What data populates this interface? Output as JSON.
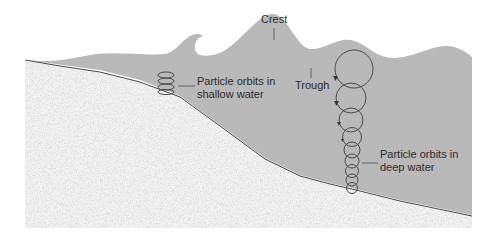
{
  "diagram": {
    "labels": {
      "crest": "Crest",
      "trough": "Trough",
      "shallow_line1": "Particle orbits in",
      "shallow_line2": "shallow water",
      "deep_line1": "Particle orbits in",
      "deep_line2": "deep water"
    },
    "colors": {
      "water": "#b9b9b9",
      "sand": "#f3f3f3",
      "sand_speckle": "#a8a8a8",
      "line": "#4a4a4a",
      "text": "#2b2b2b"
    }
  }
}
